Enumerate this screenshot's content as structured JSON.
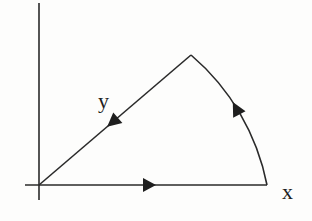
{
  "diagram": {
    "labels": {
      "x_axis": "x",
      "y_axis": "y"
    },
    "colors": {
      "stroke": "#2a2a2a",
      "background": "#fdfdfc"
    },
    "path_segments": [
      {
        "name": "segment-1",
        "type": "line",
        "from": "origin",
        "to": "arc-start",
        "direction": "rightward"
      },
      {
        "name": "segment-2",
        "type": "arc",
        "from": "arc-start",
        "to": "apex",
        "direction": "counterclockwise"
      },
      {
        "name": "segment-3",
        "type": "line",
        "from": "apex",
        "to": "origin",
        "direction": "toward origin"
      }
    ]
  }
}
